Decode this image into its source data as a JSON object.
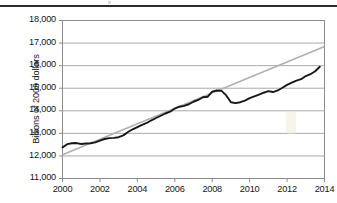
{
  "figure": {
    "name": "real-gdp-vs-potential-gdp-chart",
    "top_rule": true,
    "watermark_artifact": true
  },
  "axis": {
    "y_title": "Billions of 2009 dollars",
    "y_ticks": [
      "11,000",
      "12,000",
      "13,000",
      "14,000",
      "15,000",
      "16,000",
      "17,000",
      "18,000"
    ],
    "x_ticks": [
      "2000",
      "2002",
      "2004",
      "2006",
      "2008",
      "2010",
      "2012",
      "2014"
    ]
  },
  "colors": {
    "actual_line": "#171717",
    "trend_line": "#b0b0b0",
    "gridline": "#a9a9a9",
    "axis_frame": "#8c8c8c",
    "top_rule": "#2b2b2b",
    "text": "#141414"
  },
  "chart_data": {
    "type": "line",
    "title": "",
    "xlabel": "",
    "ylabel": "Billions of 2009 dollars",
    "xlim": [
      2000,
      2014
    ],
    "ylim": [
      11000,
      18000
    ],
    "ytick_values": [
      11000,
      12000,
      13000,
      14000,
      15000,
      16000,
      17000,
      18000
    ],
    "xtick_values": [
      2000,
      2002,
      2004,
      2006,
      2008,
      2010,
      2012,
      2014
    ],
    "grid": "horizontal",
    "legend": "none",
    "series": [
      {
        "name": "Actual real GDP",
        "color": "#171717",
        "width": 1.9,
        "x": [
          2000.0,
          2000.25,
          2000.5,
          2000.75,
          2001.0,
          2001.25,
          2001.5,
          2001.75,
          2002.0,
          2002.25,
          2002.5,
          2002.75,
          2003.0,
          2003.25,
          2003.5,
          2003.75,
          2004.0,
          2004.25,
          2004.5,
          2004.75,
          2005.0,
          2005.25,
          2005.5,
          2005.75,
          2006.0,
          2006.25,
          2006.5,
          2006.75,
          2007.0,
          2007.25,
          2007.5,
          2007.75,
          2008.0,
          2008.25,
          2008.5,
          2008.75,
          2009.0,
          2009.25,
          2009.5,
          2009.75,
          2010.0,
          2010.25,
          2010.5,
          2010.75,
          2011.0,
          2011.25,
          2011.5,
          2011.75,
          2012.0,
          2012.25,
          2012.5,
          2012.75,
          2013.0,
          2013.25,
          2013.5,
          2013.75
        ],
        "y": [
          12380,
          12520,
          12560,
          12570,
          12530,
          12550,
          12560,
          12600,
          12680,
          12750,
          12790,
          12800,
          12830,
          12910,
          13060,
          13180,
          13280,
          13380,
          13460,
          13580,
          13680,
          13780,
          13880,
          13960,
          14100,
          14180,
          14220,
          14290,
          14400,
          14480,
          14600,
          14620,
          14850,
          14900,
          14880,
          14680,
          14380,
          14340,
          14380,
          14450,
          14560,
          14640,
          14720,
          14800,
          14870,
          14830,
          14900,
          15020,
          15150,
          15250,
          15340,
          15400,
          15540,
          15620,
          15750,
          15950
        ]
      },
      {
        "name": "Potential GDP (trend)",
        "color": "#b0b0b0",
        "width": 1.6,
        "x": [
          2000.0,
          2014.0
        ],
        "y": [
          12050,
          16850
        ]
      }
    ],
    "annotations": []
  }
}
